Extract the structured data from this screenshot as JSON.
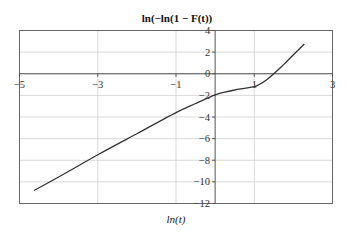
{
  "chart_data": {
    "type": "line",
    "title": "ln(−ln(1 − F(t))",
    "xlabel": "ln(t)",
    "ylabel": "",
    "xlim": [
      -5,
      3
    ],
    "ylim": [
      -12,
      4
    ],
    "grid": true,
    "legend": null,
    "xticks": [
      -5,
      -3,
      -1,
      1,
      3
    ],
    "xtick_labels": [
      "−5",
      "−3",
      "−1",
      "1",
      "3"
    ],
    "yticks": [
      4,
      2,
      0,
      -2,
      -4,
      -6,
      -8,
      -10,
      -12
    ],
    "ytick_labels": [
      "4",
      "2",
      "0",
      "−2",
      "−4",
      "−6",
      "−8",
      "−10",
      "−12"
    ],
    "series": [
      {
        "name": "ln(−ln(1 − F(t)))",
        "color": "#333333",
        "x": [
          -4.63,
          -4.0,
          -3.0,
          -2.0,
          -1.0,
          -0.5,
          0.0,
          0.25,
          0.5,
          0.75,
          1.0,
          1.15,
          1.3,
          1.5,
          1.75,
          2.0,
          2.28
        ],
        "y": [
          -10.8,
          -9.55,
          -7.5,
          -5.55,
          -3.6,
          -2.75,
          -1.95,
          -1.7,
          -1.5,
          -1.35,
          -1.2,
          -0.95,
          -0.6,
          0.0,
          0.85,
          1.75,
          2.75
        ]
      }
    ]
  }
}
